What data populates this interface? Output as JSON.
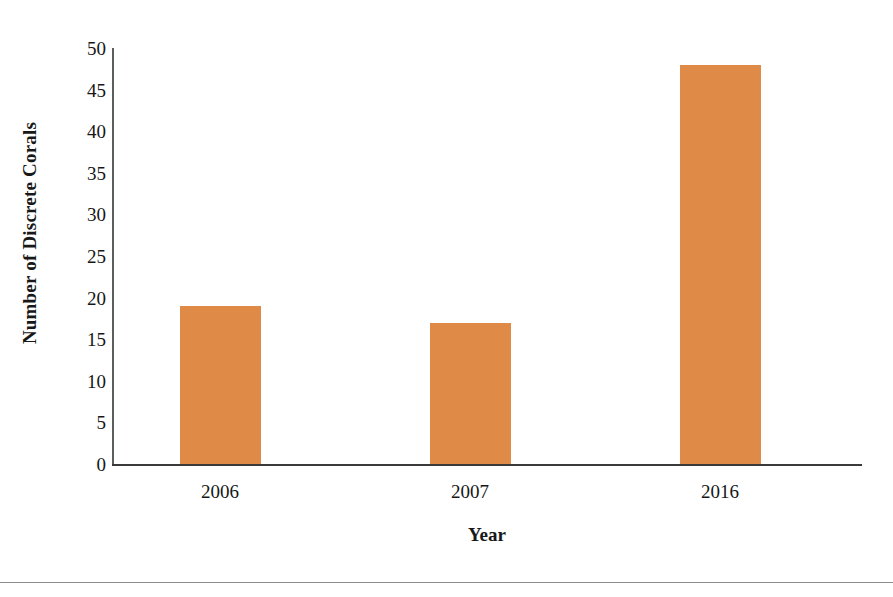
{
  "chart_data": {
    "type": "bar",
    "title": "",
    "subtitle": "",
    "categories": [
      "2006",
      "2007",
      "2016"
    ],
    "values": [
      19,
      17,
      48
    ],
    "series": [
      {
        "name": "Number of Discrete Corals",
        "values": [
          19,
          17,
          48
        ]
      }
    ],
    "xlabel": "Year",
    "ylabel": "Number of Discrete Corals",
    "ylim": [
      0,
      50
    ],
    "yticks": [
      0,
      5,
      10,
      15,
      20,
      25,
      30,
      35,
      40,
      45,
      50
    ],
    "ytick_labels": [
      "0",
      "5",
      "10",
      "15",
      "20",
      "25",
      "30",
      "35",
      "40",
      "45",
      "50"
    ],
    "grid": false,
    "legend": false,
    "legend_position": "none",
    "bar_color": "#e08a48",
    "axis_color": "#3a3a3a",
    "background": "#ffffff"
  },
  "axes": {
    "y_title": "Number of Discrete Corals",
    "x_title": "Year"
  }
}
